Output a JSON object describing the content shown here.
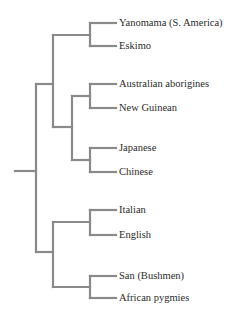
{
  "diagram": {
    "type": "phylogenetic-tree",
    "line_color": "#8a8a8a",
    "text_color": "#2b2b2b",
    "leaves": [
      {
        "label": "Yanomama (S. America)",
        "y": 23
      },
      {
        "label": "Eskimo",
        "y": 46
      },
      {
        "label": "Australian aborigines",
        "y": 84
      },
      {
        "label": "New Guinean",
        "y": 108
      },
      {
        "label": "Japanese",
        "y": 148
      },
      {
        "label": "Chinese",
        "y": 172
      },
      {
        "label": "Italian",
        "y": 210
      },
      {
        "label": "English",
        "y": 235
      },
      {
        "label": "San (Bushmen)",
        "y": 276
      },
      {
        "label": "African pygmies",
        "y": 298
      }
    ],
    "clades": [
      {
        "name": "americas",
        "members": [
          "Yanomama (S. America)",
          "Eskimo"
        ]
      },
      {
        "name": "oceania",
        "members": [
          "Australian aborigines",
          "New Guinean"
        ]
      },
      {
        "name": "east-asia",
        "members": [
          "Japanese",
          "Chinese"
        ]
      },
      {
        "name": "europe",
        "members": [
          "Italian",
          "English"
        ]
      },
      {
        "name": "africa",
        "members": [
          "San (Bushmen)",
          "African pygmies"
        ]
      }
    ]
  }
}
